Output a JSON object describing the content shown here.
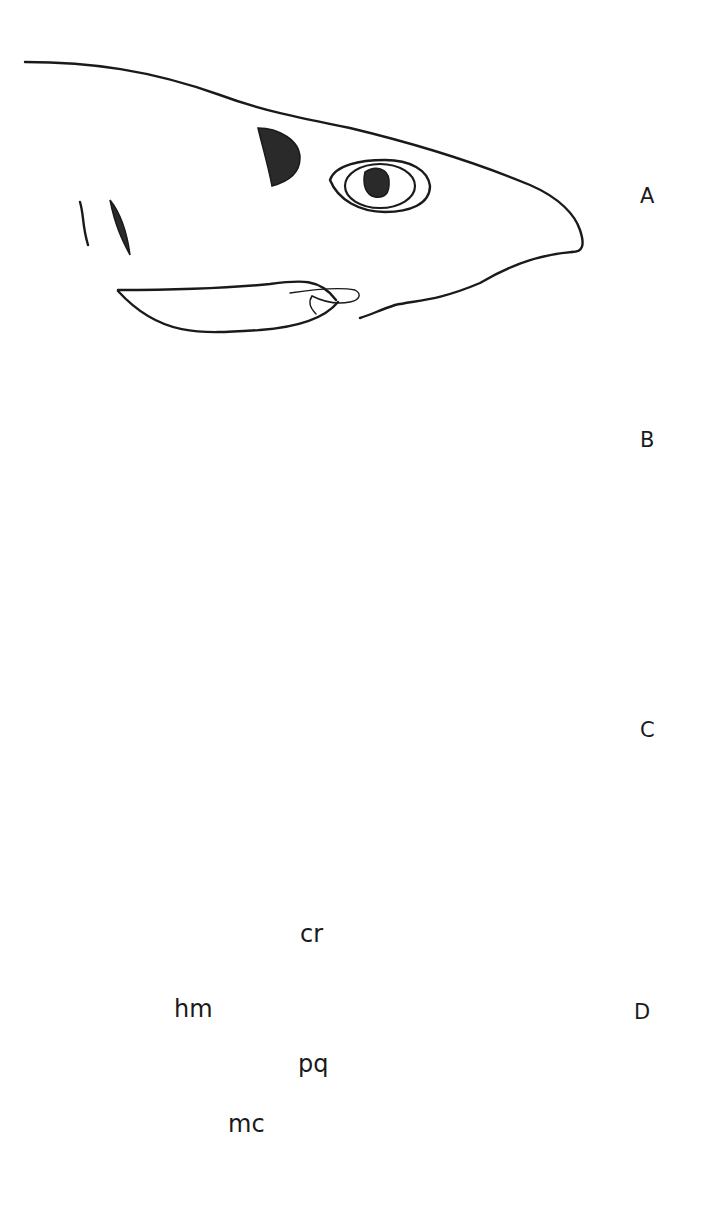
{
  "figure": {
    "panels": [
      {
        "id": "A",
        "label": "A",
        "stage": "jaws at rest, mouth closed"
      },
      {
        "id": "B",
        "label": "B",
        "stage": "mouth opening, lower jaw depressed"
      },
      {
        "id": "C",
        "label": "C",
        "stage": "upper jaw protruded, teeth exposed"
      },
      {
        "id": "D",
        "label": "D",
        "stage": "skeletal elements of jaw apparatus"
      }
    ],
    "skeletal_labels": {
      "cranium": "cr",
      "hyomandibula": "hm",
      "palatoquadrate": "pq",
      "meckels_cartilage": "mc"
    },
    "colors": {
      "line": "#1a1a1a",
      "fill": "#2a2a2a",
      "background": "#ffffff"
    }
  }
}
